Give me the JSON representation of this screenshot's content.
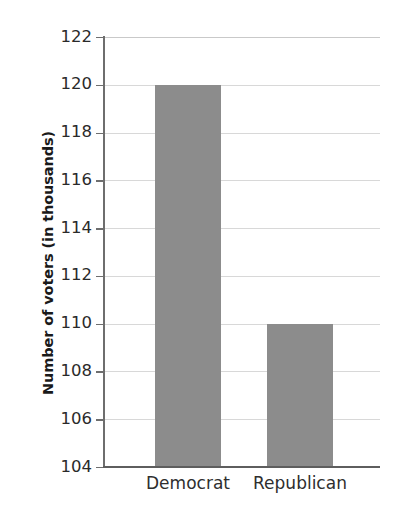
{
  "chart_data": {
    "type": "bar",
    "title": "",
    "subtitle": "",
    "xlabel": "",
    "ylabel": "Number of voters (in thousands)",
    "categories": [
      "Democrat",
      "Republican"
    ],
    "values": [
      120,
      110
    ],
    "ylim": [
      104,
      122
    ],
    "ytick_step": 2,
    "yticks": [
      104,
      106,
      108,
      110,
      112,
      114,
      116,
      118,
      120,
      122
    ],
    "ytick_labels": [
      "104",
      "106",
      "108",
      "110",
      "112",
      "114",
      "116",
      "118",
      "120",
      "122"
    ],
    "grid": true,
    "grid_axis": "y",
    "legend": false,
    "legend_position": "none",
    "bar_color": "#8c8c8c",
    "axis_color": "#6e6e6e",
    "gridline_color": "#d8d8d8",
    "text_color": "#2a2a2a",
    "background": "#ffffff",
    "series": [
      {
        "name": "Number of voters",
        "values": [
          120,
          110
        ]
      }
    ],
    "points": [
      {
        "category": "Democrat",
        "value": 120
      },
      {
        "category": "Republican",
        "value": 110
      }
    ]
  }
}
